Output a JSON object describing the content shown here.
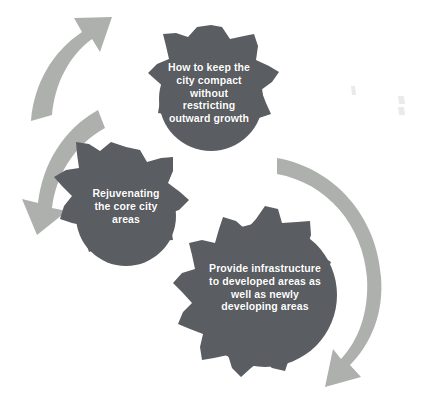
{
  "diagram": {
    "background_color": "#ffffff",
    "gear_color": "#5a5d61",
    "arrow_color": "#aeb0ae",
    "label_color": "#ffffff",
    "gears": [
      {
        "id": "top",
        "name": "gear-top",
        "text": "How to keep the city compact without restricting outward growth",
        "lines": [
          "How to keep the",
          "city compact",
          "without",
          "restricting",
          "outward growth"
        ],
        "teeth": 9,
        "center": [
          211,
          99
        ],
        "radius": 62
      },
      {
        "id": "middle",
        "name": "gear-middle-left",
        "text": "Rejuvenating the core city areas",
        "lines": [
          "Rejuvenating",
          "the core city",
          "areas"
        ],
        "teeth": 8,
        "center": [
          126,
          216
        ],
        "radius": 58
      },
      {
        "id": "bottom",
        "name": "gear-bottom-right",
        "text": "Provide infrastructure to developed areas as well as newly developing areas",
        "lines": [
          "Provide infrastructure",
          "to developed areas as",
          "well as newly",
          "developing areas"
        ],
        "teeth": 11,
        "center": [
          265,
          295
        ],
        "radius": 82
      }
    ],
    "arrows": [
      {
        "id": "arrow-up",
        "name": "arrow-curved-up-right",
        "direction": "up-right",
        "points_to": "gear-top"
      },
      {
        "id": "arrow-down",
        "name": "arrow-curved-down-left",
        "direction": "down-left",
        "points_to": "gear-middle-left"
      },
      {
        "id": "arrow-right",
        "name": "arrow-curved-right-down",
        "direction": "down-left",
        "points_to": "gear-bottom-right"
      }
    ],
    "artifacts": [
      {
        "name": "scan-speck-upper",
        "x": 353,
        "y": 90
      },
      {
        "name": "scan-speck-right",
        "x": 401,
        "y": 103
      }
    ]
  }
}
